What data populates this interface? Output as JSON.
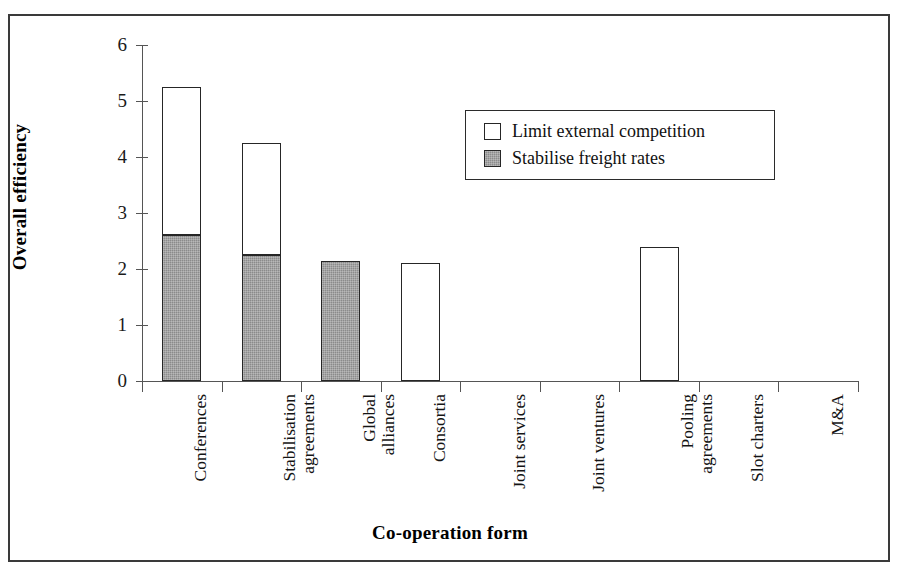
{
  "chart_data": {
    "type": "bar",
    "stacked": true,
    "title": "",
    "xlabel": "Co-operation form",
    "ylabel": "Overall efficiency",
    "ylim": [
      0,
      6
    ],
    "yticks": [
      0,
      1,
      2,
      3,
      4,
      5,
      6
    ],
    "ytick_labels": [
      "0",
      "1",
      "2",
      "3",
      "4",
      "5",
      "6"
    ],
    "grid": false,
    "legend_position": "upper right inside",
    "categories": [
      "Conferences",
      "Stabilisation agreements",
      "Global alliances",
      "Consortia",
      "Joint services",
      "Joint ventures",
      "Pooling agreements",
      "Slot charters",
      "M&A"
    ],
    "category_lines": [
      [
        "Conferences"
      ],
      [
        "Stabilisation",
        "agreements"
      ],
      [
        "Global",
        "alliances"
      ],
      [
        "Consortia"
      ],
      [
        "Joint services"
      ],
      [
        "Joint ventures"
      ],
      [
        "Pooling",
        "agreements"
      ],
      [
        "Slot charters"
      ],
      [
        "M&A"
      ]
    ],
    "series": [
      {
        "name": "Stabilise freight rates",
        "fill": "gray",
        "color": "#8b8b8b",
        "values": [
          2.6,
          2.25,
          2.15,
          0,
          0,
          0,
          0,
          0,
          0
        ]
      },
      {
        "name": "Limit external competition",
        "fill": "white",
        "color": "#ffffff",
        "values": [
          2.65,
          2.0,
          0,
          2.1,
          0,
          0,
          2.4,
          0,
          0
        ]
      }
    ],
    "totals": [
      5.25,
      4.25,
      2.15,
      2.1,
      0,
      0,
      2.4,
      0,
      0
    ]
  },
  "legend": {
    "items": [
      {
        "label": "Limit external competition",
        "swatch": "white"
      },
      {
        "label": "Stabilise freight rates",
        "swatch": "gray"
      }
    ]
  },
  "colors": {
    "gray_fill": "#8b8b8b",
    "white_fill": "#ffffff",
    "outline": "#262626",
    "axis": "#555555",
    "frame": "#3a3a3a"
  }
}
